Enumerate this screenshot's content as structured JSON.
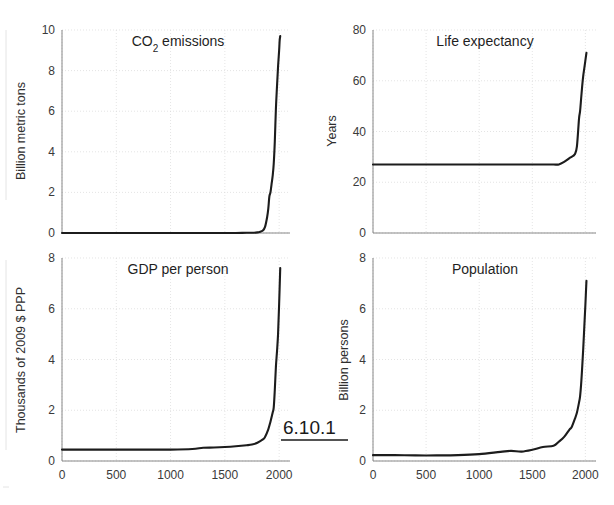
{
  "figure": {
    "number_label": "6.10.1",
    "xlabel_shared": "Year"
  },
  "axis_ticks": {
    "x": [
      "0",
      "500",
      "1000",
      "1500",
      "2000"
    ],
    "y_co2": [
      "0",
      "2",
      "4",
      "6",
      "8",
      "10"
    ],
    "y_life": [
      "0",
      "20",
      "40",
      "60",
      "80"
    ],
    "y_gdp": [
      "0",
      "2",
      "4",
      "6",
      "8"
    ],
    "y_pop": [
      "0",
      "2",
      "4",
      "6",
      "8"
    ]
  },
  "colors": {
    "curve": "#1c1c1c",
    "grid": "#d8d8d8",
    "axis": "#7a7a7a",
    "text": "#2b2b2b",
    "background": "#ffffff"
  },
  "chart_data": [
    {
      "type": "line",
      "id": "co2-emissions",
      "title": "CO₂ emissions",
      "title_plain": "CO2 emissions",
      "xlabel": "",
      "ylabel": "Billion metric tons",
      "xlim": [
        0,
        2100
      ],
      "ylim": [
        0,
        10
      ],
      "xticks": [
        0,
        500,
        1000,
        1500,
        2000
      ],
      "yticks": [
        0,
        2,
        4,
        6,
        8,
        10
      ],
      "grid": true,
      "legend": "none",
      "x": [
        0,
        200,
        400,
        600,
        800,
        1000,
        1200,
        1400,
        1500,
        1600,
        1700,
        1750,
        1800,
        1820,
        1850,
        1870,
        1890,
        1900,
        1910,
        1920,
        1930,
        1940,
        1950,
        1960,
        1970,
        1980,
        1990,
        2000,
        2005,
        2010
      ],
      "values": [
        0.0,
        0.0,
        0.0,
        0.0,
        0.0,
        0.0,
        0.0,
        0.0,
        0.0,
        0.0,
        0.01,
        0.01,
        0.03,
        0.05,
        0.12,
        0.3,
        0.8,
        1.2,
        1.8,
        2.0,
        2.4,
        2.8,
        3.4,
        4.5,
        6.1,
        7.2,
        8.2,
        9.0,
        9.5,
        9.7
      ]
    },
    {
      "type": "line",
      "id": "life-expectancy",
      "title": "Life expectancy",
      "xlabel": "",
      "ylabel": "Years",
      "xlim": [
        0,
        2100
      ],
      "ylim": [
        0,
        80
      ],
      "xticks": [
        0,
        500,
        1000,
        1500,
        2000
      ],
      "yticks": [
        0,
        20,
        40,
        60,
        80
      ],
      "grid": true,
      "legend": "none",
      "x": [
        0,
        200,
        400,
        600,
        800,
        1000,
        1200,
        1400,
        1500,
        1600,
        1700,
        1750,
        1800,
        1850,
        1870,
        1900,
        1920,
        1940,
        1950,
        1960,
        1970,
        1980,
        1990,
        2000,
        2010
      ],
      "values": [
        27,
        27,
        27,
        27,
        27,
        27,
        27,
        27,
        27,
        27,
        27,
        27,
        28,
        29.5,
        30,
        31,
        34,
        45,
        48,
        53,
        58,
        62,
        65,
        68,
        71
      ]
    },
    {
      "type": "line",
      "id": "gdp-per-person",
      "title": "GDP per person",
      "xlabel": "",
      "ylabel": "Thousands of 2009 $ PPP",
      "xlim": [
        0,
        2100
      ],
      "ylim": [
        0,
        8
      ],
      "xticks": [
        0,
        500,
        1000,
        1500,
        2000
      ],
      "yticks": [
        0,
        2,
        4,
        6,
        8
      ],
      "grid": true,
      "legend": "none",
      "x": [
        0,
        200,
        400,
        600,
        800,
        1000,
        1200,
        1300,
        1400,
        1500,
        1600,
        1700,
        1750,
        1800,
        1850,
        1870,
        1900,
        1920,
        1940,
        1950,
        1960,
        1970,
        1980,
        1990,
        2000,
        2010
      ],
      "values": [
        0.45,
        0.45,
        0.45,
        0.45,
        0.45,
        0.45,
        0.47,
        0.52,
        0.53,
        0.55,
        0.58,
        0.62,
        0.65,
        0.72,
        0.85,
        0.95,
        1.25,
        1.55,
        1.9,
        2.1,
        2.8,
        3.7,
        4.3,
        5.0,
        6.2,
        7.6
      ]
    },
    {
      "type": "line",
      "id": "population",
      "title": "Population",
      "xlabel": "",
      "ylabel": "Billion persons",
      "xlim": [
        0,
        2100
      ],
      "ylim": [
        0,
        8
      ],
      "xticks": [
        0,
        500,
        1000,
        1500,
        2000
      ],
      "yticks": [
        0,
        2,
        4,
        6,
        8
      ],
      "grid": true,
      "legend": "none",
      "x": [
        0,
        200,
        400,
        600,
        800,
        1000,
        1200,
        1300,
        1400,
        1500,
        1600,
        1700,
        1750,
        1800,
        1850,
        1870,
        1900,
        1920,
        1940,
        1950,
        1960,
        1970,
        1980,
        1990,
        2000,
        2010
      ],
      "values": [
        0.23,
        0.23,
        0.22,
        0.22,
        0.23,
        0.27,
        0.36,
        0.4,
        0.37,
        0.44,
        0.55,
        0.6,
        0.76,
        0.95,
        1.24,
        1.33,
        1.65,
        1.9,
        2.3,
        2.55,
        3.03,
        3.7,
        4.45,
        5.3,
        6.15,
        7.1
      ]
    }
  ]
}
